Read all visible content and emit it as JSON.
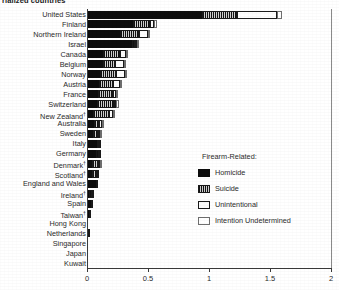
{
  "chart_data": {
    "type": "bar",
    "orientation": "horizontal",
    "title": "rialized countries",
    "xlabel": "",
    "ylabel": "",
    "xlim": [
      0,
      2
    ],
    "xticks": [
      0,
      0.5,
      1,
      1.5,
      2
    ],
    "xtick_labels": [
      "0",
      "0.5",
      "1",
      "1.5",
      "2"
    ],
    "grid": false,
    "stacked": true,
    "legend": {
      "title": "Firearm-Related:",
      "position": "center-right",
      "entries": [
        {
          "name": "Homicide",
          "key": "homicide",
          "color": "#0d0d0d"
        },
        {
          "name": "Suicide",
          "key": "suicide",
          "color": "#c9c9c9"
        },
        {
          "name": "Unintentional",
          "key": "unintentional",
          "color": "#fdfdfd"
        },
        {
          "name": "Intention Undetermined",
          "key": "undetermined",
          "color": "#ffffff"
        }
      ]
    },
    "categories": [
      "United States",
      "Finland",
      "Northern Ireland",
      "Israel",
      "Canada",
      "Belgium",
      "Norway",
      "Austria",
      "France",
      "Switzerland",
      "New Zealand†",
      "Australia",
      "Sweden",
      "Italy",
      "Germany",
      "Denmark†",
      "Scotland†",
      "England and Wales",
      "Ireland†",
      "Spain",
      "Taiwan†",
      "Hong Kong",
      "Netherlands",
      "Singapore",
      "Japan",
      "Kuwait"
    ],
    "series": [
      {
        "name": "Homicide",
        "key": "homicide",
        "values": [
          0.94,
          0.38,
          0.27,
          0.37,
          0.13,
          0.13,
          0.11,
          0.1,
          0.09,
          0.08,
          0.05,
          0.06,
          0.05,
          0.08,
          0.07,
          0.04,
          0.04,
          0.07,
          0.02,
          0.03,
          0.02,
          0.01,
          0.01,
          0.01,
          0.01,
          0.0
        ]
      },
      {
        "name": "Suicide",
        "key": "suicide",
        "values": [
          0.29,
          0.14,
          0.16,
          0.02,
          0.14,
          0.1,
          0.13,
          0.11,
          0.12,
          0.14,
          0.13,
          0.04,
          0.04,
          0.02,
          0.03,
          0.05,
          0.04,
          0.01,
          0.02,
          0.01,
          0.01,
          0.0,
          0.01,
          0.0,
          0.0,
          0.0
        ]
      },
      {
        "name": "Unintentional",
        "key": "unintentional",
        "values": [
          0.33,
          0.03,
          0.07,
          0.02,
          0.05,
          0.07,
          0.07,
          0.06,
          0.03,
          0.02,
          0.03,
          0.02,
          0.02,
          0.01,
          0.01,
          0.01,
          0.01,
          0.0,
          0.02,
          0.0,
          0.0,
          0.0,
          0.0,
          0.0,
          0.0,
          0.0
        ]
      },
      {
        "name": "Intention Undetermined",
        "key": "undetermined",
        "values": [
          0.04,
          0.02,
          0.02,
          0.01,
          0.02,
          0.01,
          0.01,
          0.01,
          0.01,
          0.02,
          0.01,
          0.01,
          0.01,
          0.0,
          0.0,
          0.01,
          0.0,
          0.0,
          0.0,
          0.0,
          0.0,
          0.0,
          0.0,
          0.0,
          0.0,
          0.0
        ]
      }
    ]
  }
}
